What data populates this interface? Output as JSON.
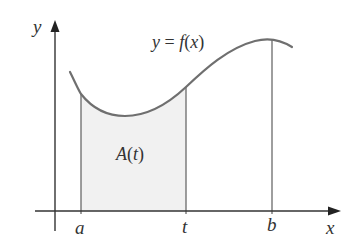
{
  "figure": {
    "colors": {
      "axis": "#333333",
      "curve": "#6f6f6f",
      "guide_lines": "#6a6a6a",
      "shaded_region": "#f1f1f1",
      "text": "#333333"
    },
    "axes": {
      "y_label": "y",
      "x_label": "x"
    },
    "curve": {
      "label": "y = f(x)",
      "label_parts": {
        "lhs": "y",
        "eq": " = ",
        "func": "f",
        "open": "(",
        "arg": "x",
        "close": ")"
      }
    },
    "shaded_region": {
      "label": "A(t)",
      "label_parts": {
        "func": "A",
        "open": "(",
        "arg": "t",
        "close": ")"
      }
    },
    "tick_labels": {
      "a": "a",
      "t": "t",
      "b": "b"
    }
  }
}
